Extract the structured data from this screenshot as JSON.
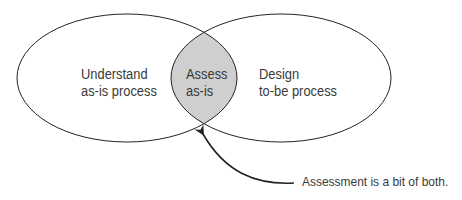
{
  "diagram": {
    "type": "venn",
    "left_circle": {
      "line1": "Understand",
      "line2": "as-is process"
    },
    "right_circle": {
      "line1": "Design",
      "line2": "to-be process"
    },
    "overlap": {
      "line1": "Assess",
      "line2": "as-is",
      "fill": "#cfcfcf"
    },
    "callout": {
      "text": "Assessment is a bit of both."
    },
    "colors": {
      "stroke": "#222222",
      "text": "#3a3a3a",
      "background": "#ffffff"
    }
  }
}
